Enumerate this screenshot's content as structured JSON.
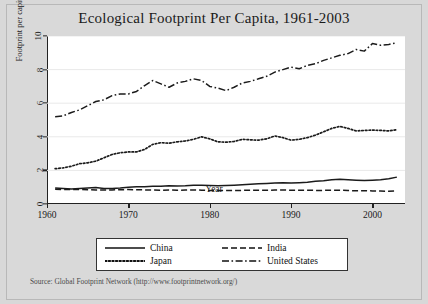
{
  "chart_data": {
    "type": "line",
    "title": "Ecological Footprint Per Capita, 1961-2003",
    "xlabel": "Year",
    "ylabel": "Footprint per capita, hectares",
    "xlim": [
      1960,
      2004
    ],
    "ylim": [
      0,
      10
    ],
    "xticks": [
      "1960",
      "1970",
      "1980",
      "1990",
      "2000"
    ],
    "yticks": [
      "0",
      "2",
      "4",
      "6",
      "8",
      "10"
    ],
    "grid": "horizontal",
    "legend_position": "below-plot",
    "source_note": "Source: Global Footprint Network (http://www.footprintnetwork.org/)",
    "x": [
      1961,
      1962,
      1963,
      1964,
      1965,
      1966,
      1967,
      1968,
      1969,
      1970,
      1971,
      1972,
      1973,
      1974,
      1975,
      1976,
      1977,
      1978,
      1979,
      1980,
      1981,
      1982,
      1983,
      1984,
      1985,
      1986,
      1987,
      1988,
      1989,
      1990,
      1991,
      1992,
      1993,
      1994,
      1995,
      1996,
      1997,
      1998,
      1999,
      2000,
      2001,
      2002,
      2003
    ],
    "series": [
      {
        "name": "China",
        "dash": "solid",
        "values": [
          0.95,
          0.92,
          0.9,
          0.92,
          0.95,
          0.98,
          0.93,
          0.92,
          0.95,
          1.0,
          1.02,
          1.03,
          1.05,
          1.05,
          1.08,
          1.07,
          1.08,
          1.12,
          1.12,
          1.1,
          1.08,
          1.1,
          1.12,
          1.15,
          1.18,
          1.2,
          1.22,
          1.25,
          1.26,
          1.25,
          1.27,
          1.3,
          1.35,
          1.38,
          1.45,
          1.48,
          1.45,
          1.42,
          1.4,
          1.42,
          1.45,
          1.5,
          1.6
        ]
      },
      {
        "name": "India",
        "dash": "dashed",
        "values": [
          0.88,
          0.86,
          0.87,
          0.86,
          0.85,
          0.83,
          0.84,
          0.84,
          0.85,
          0.86,
          0.85,
          0.84,
          0.83,
          0.82,
          0.83,
          0.82,
          0.83,
          0.84,
          0.82,
          0.8,
          0.8,
          0.8,
          0.81,
          0.81,
          0.82,
          0.82,
          0.82,
          0.83,
          0.83,
          0.82,
          0.82,
          0.82,
          0.81,
          0.81,
          0.82,
          0.82,
          0.8,
          0.79,
          0.79,
          0.78,
          0.77,
          0.76,
          0.78
        ]
      },
      {
        "name": "Japan",
        "dash": "dotted",
        "values": [
          2.1,
          2.15,
          2.25,
          2.4,
          2.45,
          2.55,
          2.75,
          2.95,
          3.05,
          3.1,
          3.1,
          3.25,
          3.55,
          3.65,
          3.62,
          3.7,
          3.75,
          3.85,
          4.0,
          3.88,
          3.7,
          3.68,
          3.72,
          3.85,
          3.82,
          3.8,
          3.88,
          4.05,
          3.95,
          3.8,
          3.85,
          3.95,
          4.1,
          4.3,
          4.5,
          4.62,
          4.5,
          4.35,
          4.38,
          4.4,
          4.38,
          4.35,
          4.42
        ]
      },
      {
        "name": "United States",
        "dash": "dashdot",
        "values": [
          5.2,
          5.25,
          5.45,
          5.6,
          5.85,
          6.1,
          6.2,
          6.45,
          6.55,
          6.55,
          6.7,
          7.05,
          7.35,
          7.15,
          6.95,
          7.2,
          7.3,
          7.45,
          7.35,
          7.0,
          6.9,
          6.75,
          6.95,
          7.2,
          7.3,
          7.45,
          7.6,
          7.85,
          8.0,
          8.15,
          8.05,
          8.25,
          8.35,
          8.55,
          8.7,
          8.85,
          8.95,
          9.2,
          9.1,
          9.55,
          9.45,
          9.5,
          9.6
        ]
      }
    ]
  }
}
